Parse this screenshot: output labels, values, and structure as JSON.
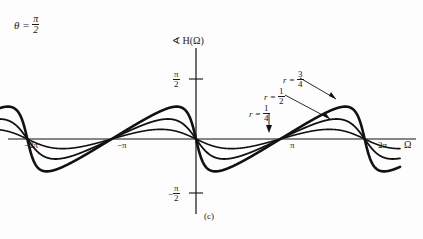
{
  "figure": {
    "caption": "(c)",
    "theta_label": {
      "symbol": "θ",
      "equals": "=",
      "num": "π",
      "den": "2"
    },
    "y_axis_title": {
      "angle_icon": "∢",
      "text": "H(Ω)"
    },
    "x_axis_title": "Ω",
    "x_ticks": [
      {
        "label": "−2π",
        "value": -6.2832
      },
      {
        "label": "−π",
        "value": -3.1416
      },
      {
        "label": "π",
        "value": 3.1416
      },
      {
        "label": "2π",
        "value": 6.2832
      }
    ],
    "y_ticks": [
      {
        "label_num": "π",
        "label_den": "2",
        "sign": "",
        "value": 1.5708
      },
      {
        "label_num": "π",
        "label_den": "2",
        "sign": "−",
        "value": -1.5708
      }
    ],
    "curve_labels": [
      {
        "id": "r-three-quarters",
        "prefix": "r =",
        "num": "3",
        "den": "4"
      },
      {
        "id": "r-one-half",
        "prefix": "r =",
        "num": "1",
        "den": "2"
      },
      {
        "id": "r-one-quarter",
        "prefix": "r =",
        "num": "1",
        "den": "4"
      }
    ],
    "ink_color": "#111111"
  },
  "chart_data": {
    "type": "line",
    "title": "∢ H(Ω)",
    "xlabel": "Ω",
    "ylabel": "∢ H(Ω)",
    "xlim": [
      -7.6,
      7.6
    ],
    "ylim": [
      -2.2,
      2.2
    ],
    "grid": false,
    "legend": "inline-annotations",
    "xticks": [
      -6.2832,
      -3.1416,
      3.1416,
      6.2832
    ],
    "xticklabels": [
      "−2π",
      "−π",
      "π",
      "2π"
    ],
    "yticks": [
      1.5708,
      -1.5708
    ],
    "yticklabels": [
      "π/2",
      "−π/2"
    ],
    "series": [
      {
        "name": "r = 1/4",
        "r": 0.25,
        "amplitude": 0.2527,
        "linewidth": 1.6,
        "description": "phase of H(Ω)=1/(1-r e^{-jΩ}) with θ=π/2; small ripple"
      },
      {
        "name": "r = 1/2",
        "r": 0.5,
        "amplitude": 0.5236,
        "linewidth": 1.8,
        "description": "medium ripple, peaks near ±0.52 rad"
      },
      {
        "name": "r = 3/4",
        "r": 0.75,
        "amplitude": 0.8481,
        "linewidth": 2.6,
        "description": "largest ripple, sharper peaks near ±0.85 rad"
      }
    ],
    "formula": "angle H(Ω) = -arctan( r sinΩ / (1 - r cosΩ) )",
    "period": 6.2832,
    "zero_crossings": [
      -6.2832,
      -3.1416,
      0,
      3.1416,
      6.2832
    ]
  }
}
